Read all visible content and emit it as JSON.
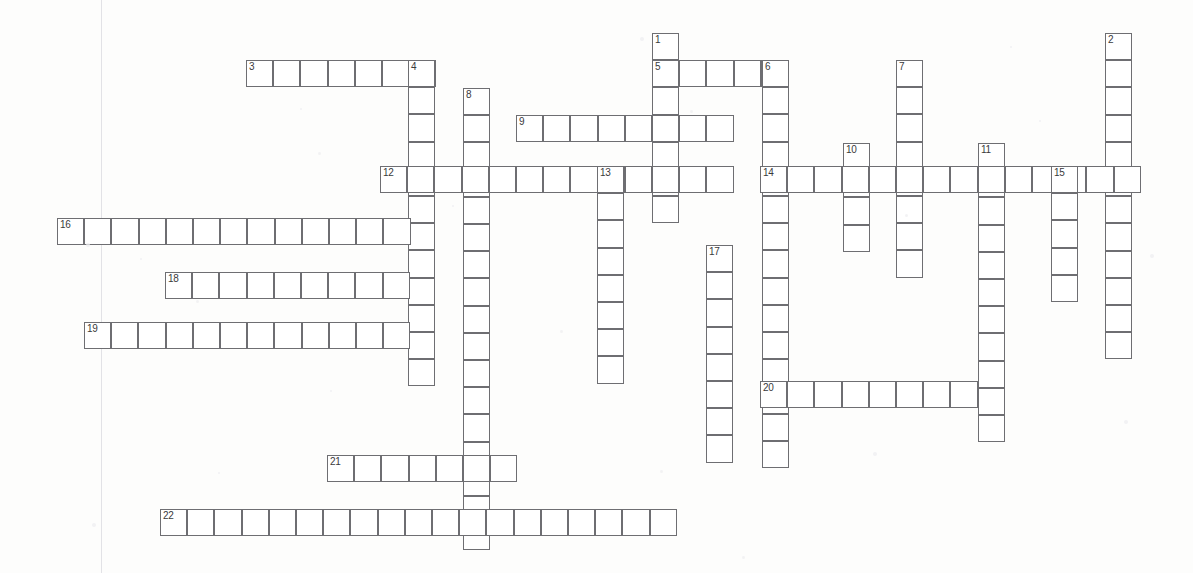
{
  "document": {
    "type": "crossword-puzzle-grid",
    "title": "Crossword Puzzle Grid",
    "width": 1193,
    "height": 573,
    "cell_size": 27.2,
    "cell_border_color": "#6e6e72",
    "cell_fill_color": "#ffffff",
    "page_background": "#fdfdfc",
    "number_color": "#3a3a3c"
  },
  "margin_line": {
    "x": 101,
    "color": "#e2e2e6"
  },
  "entries": [
    {
      "number": "1",
      "direction": "down",
      "x": 652,
      "y": 33,
      "length": 7,
      "label_cell": 0
    },
    {
      "number": "2",
      "direction": "down",
      "x": 1105,
      "y": 33,
      "length": 12,
      "label_cell": 0
    },
    {
      "number": "3",
      "direction": "across",
      "x": 246,
      "y": 60,
      "length": 7,
      "label_cell": 0
    },
    {
      "number": "4",
      "direction": "down",
      "x": 408,
      "y": 60,
      "length": 12,
      "label_cell": 0
    },
    {
      "number": "5",
      "direction": "across",
      "x": 652,
      "y": 60,
      "length": 5,
      "label_cell": 0
    },
    {
      "number": "6",
      "direction": "down",
      "x": 762,
      "y": 60,
      "length": 15,
      "label_cell": 0
    },
    {
      "number": "7",
      "direction": "down",
      "x": 896,
      "y": 60,
      "length": 8,
      "label_cell": 0
    },
    {
      "number": "8",
      "direction": "down",
      "x": 463,
      "y": 88,
      "length": 17,
      "label_cell": 0
    },
    {
      "number": "9",
      "direction": "across",
      "x": 516,
      "y": 115,
      "length": 8,
      "label_cell": 0
    },
    {
      "number": "10",
      "direction": "down",
      "x": 843,
      "y": 143,
      "length": 4,
      "label_cell": 0
    },
    {
      "number": "11",
      "direction": "down",
      "x": 978,
      "y": 143,
      "length": 11,
      "label_cell": 0
    },
    {
      "number": "12",
      "direction": "across",
      "x": 380,
      "y": 166,
      "length": 13,
      "label_cell": 0
    },
    {
      "number": "13",
      "direction": "down",
      "x": 597,
      "y": 166,
      "length": 8,
      "label_cell": 0
    },
    {
      "number": "14",
      "direction": "across",
      "x": 760,
      "y": 166,
      "length": 14,
      "label_cell": 0
    },
    {
      "number": "15",
      "direction": "down",
      "x": 1051,
      "y": 166,
      "length": 5,
      "label_cell": 0
    },
    {
      "number": "16",
      "direction": "across",
      "x": 57,
      "y": 218,
      "length": 13,
      "label_cell": 0
    },
    {
      "number": "17",
      "direction": "down",
      "x": 706,
      "y": 245,
      "length": 8,
      "label_cell": 0
    },
    {
      "number": "18",
      "direction": "across",
      "x": 165,
      "y": 272,
      "length": 9,
      "label_cell": 0
    },
    {
      "number": "19",
      "direction": "across",
      "x": 84,
      "y": 322,
      "length": 12,
      "label_cell": 0
    },
    {
      "number": "20",
      "direction": "across",
      "x": 760,
      "y": 381,
      "length": 8,
      "label_cell": 0
    },
    {
      "number": "21",
      "direction": "across",
      "x": 327,
      "y": 455,
      "length": 7,
      "label_cell": 0
    },
    {
      "number": "22",
      "direction": "across",
      "x": 160,
      "y": 509,
      "length": 19,
      "label_cell": 0
    }
  ],
  "extra_cells": [
    {
      "x": 706,
      "y": 245,
      "w": 4,
      "h": 1,
      "note": "17-across-row"
    }
  ],
  "numbers_visible": [
    "1",
    "2",
    "3",
    "4",
    "5",
    "6",
    "7",
    "8",
    "9",
    "10",
    "11",
    "12",
    "13",
    "14",
    "15",
    "16",
    "17",
    "18",
    "19",
    "20",
    "21",
    "22"
  ]
}
